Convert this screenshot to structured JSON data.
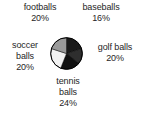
{
  "chart_data": {
    "type": "pie",
    "title": "",
    "xlabel": "",
    "ylabel": "",
    "legend_position": "around-slices",
    "grid": false,
    "categories": [
      "footballs",
      "baseballs",
      "golf balls",
      "tennis balls",
      "soccer balls"
    ],
    "values": [
      20,
      16,
      20,
      24,
      20
    ],
    "unit": "%",
    "slices": [
      {
        "name": "footballs",
        "percent_label": "20%",
        "value": 20,
        "color": "#1a1a1a",
        "start_angle": 270,
        "end_angle": 342,
        "label_lines": [
          "footballs",
          "20%"
        ]
      },
      {
        "name": "baseballs",
        "percent_label": "16%",
        "value": 16,
        "color": "#2e2e2e",
        "start_angle": 342,
        "end_angle": 39.6,
        "label_lines": [
          "baseballs",
          "16%"
        ]
      },
      {
        "name": "golf balls",
        "percent_label": "20%",
        "value": 20,
        "color": "#111111",
        "start_angle": 39.6,
        "end_angle": 111.6,
        "label_lines": [
          "golf balls",
          "20%"
        ]
      },
      {
        "name": "tennis balls",
        "percent_label": "24%",
        "value": 24,
        "color": "#f2f2f2",
        "start_angle": 111.6,
        "end_angle": 198,
        "label_lines": [
          "tennis",
          "balls",
          "24%"
        ]
      },
      {
        "name": "soccer balls",
        "percent_label": "20%",
        "value": 20,
        "color": "#9a9a9a",
        "start_angle": 198,
        "end_angle": 270,
        "label_lines": [
          "soccer",
          "balls",
          "20%"
        ]
      }
    ]
  },
  "labels": {
    "footballs": {
      "name": "footballs",
      "percent": "20%"
    },
    "baseballs": {
      "name": "baseballs",
      "percent": "16%"
    },
    "golf": {
      "name": "golf balls",
      "percent": "20%"
    },
    "tennis": {
      "name_line1": "tennis",
      "name_line2": "balls",
      "percent": "24%"
    },
    "soccer": {
      "name_line1": "soccer",
      "name_line2": "balls",
      "percent": "20%"
    }
  },
  "colors": {
    "text": "#262626",
    "background": "#ffffff",
    "outline": "#000000"
  }
}
